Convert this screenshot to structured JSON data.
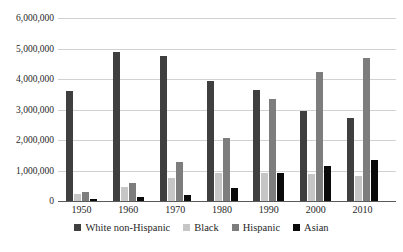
{
  "chart_data": {
    "type": "bar",
    "categories": [
      "1950",
      "1960",
      "1970",
      "1980",
      "1990",
      "2000",
      "2010"
    ],
    "series": [
      {
        "name": "White non-Hispanic",
        "color": "#3f3f3f",
        "values": [
          3600000,
          4880000,
          4760000,
          3950000,
          3640000,
          2960000,
          2730000
        ]
      },
      {
        "name": "Black",
        "color": "#c6c6c6",
        "values": [
          220000,
          460000,
          770000,
          930000,
          930000,
          900000,
          830000
        ]
      },
      {
        "name": "Hispanic",
        "color": "#7d7d7d",
        "values": [
          290000,
          580000,
          1290000,
          2070000,
          3330000,
          4240000,
          4690000
        ]
      },
      {
        "name": "Asian",
        "color": "#0a0a0a",
        "values": [
          70000,
          120000,
          190000,
          430000,
          930000,
          1140000,
          1350000
        ]
      }
    ],
    "y_axis": {
      "min": 0,
      "max": 6000000,
      "tick_step": 1000000,
      "tick_labels": [
        "0",
        "1,000,000",
        "2,000,000",
        "3,000,000",
        "4,000,000",
        "5,000,000",
        "6,000,000"
      ]
    },
    "grid": "horizontal",
    "legend_position": "bottom",
    "colors": {
      "background": "#ffffff",
      "gridline": "#d2d2d2",
      "axis_line": "#5a5a5a",
      "text": "#1f1f1f"
    }
  }
}
